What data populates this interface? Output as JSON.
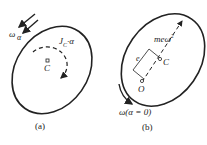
{
  "figure_a": {
    "caption": "(a)",
    "labels": {
      "omega": "ω",
      "alpha": "α",
      "inertia_torque": "J",
      "inertia_sub": "C",
      "inertia_alpha": "·α",
      "center": "C"
    }
  },
  "figure_b": {
    "caption": "(b)",
    "labels": {
      "force": "meω",
      "force_sup": "2",
      "eccentricity": "e",
      "center": "C",
      "pivot": "O",
      "omega_condition": "ω(α = 0)"
    }
  },
  "colors": {
    "stroke": "#222222",
    "background": "#ffffff"
  }
}
